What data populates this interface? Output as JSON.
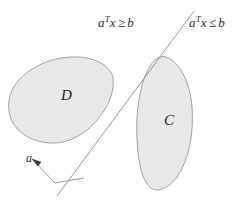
{
  "figure": {
    "width": 250,
    "height": 205,
    "background_color": "#ffffff"
  },
  "labels": {
    "halfspace_left": {
      "vector": "a",
      "transpose": "T",
      "variable": "x",
      "relation": "≥",
      "bound": "b",
      "full_text": "aᵀx ≥ b"
    },
    "halfspace_right": {
      "vector": "a",
      "transpose": "T",
      "variable": "x",
      "relation": "≤",
      "bound": "b",
      "full_text": "aᵀx ≤ b"
    },
    "set_d": "D",
    "set_c": "C",
    "normal_vector": "a"
  },
  "style": {
    "blob_fill": "#e8e8e8",
    "blob_stroke": "#9a9a9a",
    "line_color": "#8f8f8f",
    "text_color": "#2b2b2b",
    "blob_stroke_width": 0.9,
    "line_width": 0.9
  },
  "geometry": {
    "hyperplane": {
      "x1": 194,
      "y1": 11,
      "x2": 57,
      "y2": 196
    },
    "normal_arrow": {
      "x1": 55,
      "y1": 183,
      "x2": 33,
      "y2": 160
    },
    "normal_connector": {
      "x1": 55,
      "y1": 183,
      "x2": 84,
      "y2": 178
    },
    "set_d_center": [
      65,
      98
    ],
    "set_c_center": [
      168,
      123
    ]
  }
}
